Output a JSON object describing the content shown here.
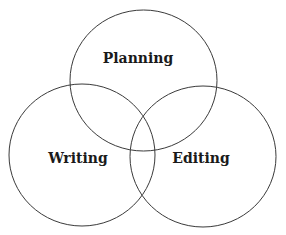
{
  "diagram": {
    "type": "venn",
    "sets": [
      {
        "label": "Planning"
      },
      {
        "label": "Writing"
      },
      {
        "label": "Editing"
      }
    ]
  }
}
